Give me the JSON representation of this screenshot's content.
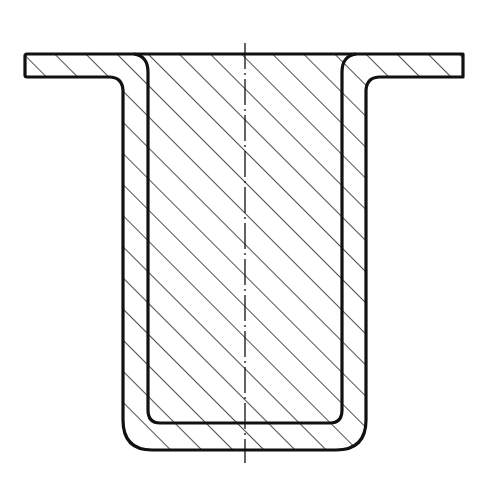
{
  "diagram": {
    "type": "technical-cross-section",
    "colors": {
      "line": "#111111",
      "background": "#ffffff",
      "hatch": "#222222"
    },
    "dimensions": {
      "width": 502,
      "height": 484
    },
    "elements": [
      {
        "id": "flange-left",
        "label": "left flange"
      },
      {
        "id": "flange-right",
        "label": "right flange"
      },
      {
        "id": "wall-left",
        "label": "left wall"
      },
      {
        "id": "wall-right",
        "label": "right wall"
      },
      {
        "id": "bottom",
        "label": "bottom"
      },
      {
        "id": "centerline",
        "label": "axis centerline (dash-dot)"
      }
    ]
  }
}
